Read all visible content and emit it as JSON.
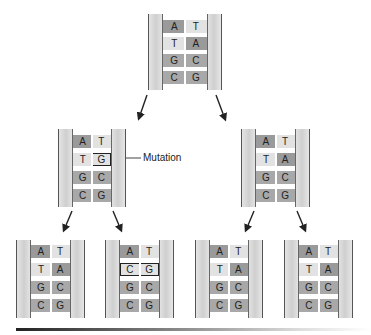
{
  "annotation": {
    "mutation_label": "Mutation"
  },
  "molecules": [
    {
      "id": "parent",
      "pairs": [
        [
          "A",
          "T"
        ],
        [
          "T",
          "A"
        ],
        [
          "G",
          "C"
        ],
        [
          "C",
          "G"
        ]
      ],
      "mutated_row": null
    },
    {
      "id": "gen1-left",
      "pairs": [
        [
          "A",
          "T"
        ],
        [
          "T",
          "G"
        ],
        [
          "G",
          "C"
        ],
        [
          "C",
          "G"
        ]
      ],
      "mutated_row": 1
    },
    {
      "id": "gen1-right",
      "pairs": [
        [
          "A",
          "T"
        ],
        [
          "T",
          "A"
        ],
        [
          "G",
          "C"
        ],
        [
          "C",
          "G"
        ]
      ],
      "mutated_row": null
    },
    {
      "id": "gen2-1",
      "pairs": [
        [
          "A",
          "T"
        ],
        [
          "T",
          "A"
        ],
        [
          "G",
          "C"
        ],
        [
          "C",
          "G"
        ]
      ],
      "mutated_row": null
    },
    {
      "id": "gen2-2",
      "pairs": [
        [
          "A",
          "T"
        ],
        [
          "C",
          "G"
        ],
        [
          "G",
          "C"
        ],
        [
          "C",
          "G"
        ]
      ],
      "mutated_row": 1
    },
    {
      "id": "gen2-3",
      "pairs": [
        [
          "A",
          "T"
        ],
        [
          "T",
          "A"
        ],
        [
          "G",
          "C"
        ],
        [
          "C",
          "G"
        ]
      ],
      "mutated_row": null
    },
    {
      "id": "gen2-4",
      "pairs": [
        [
          "A",
          "T"
        ],
        [
          "T",
          "A"
        ],
        [
          "G",
          "C"
        ],
        [
          "C",
          "G"
        ]
      ],
      "mutated_row": null
    }
  ],
  "colors": {
    "purine": "#9a9a9a",
    "pyrimidine": "#e2e2e2",
    "strand": "#cfcfcf",
    "arrow": "#222222"
  }
}
